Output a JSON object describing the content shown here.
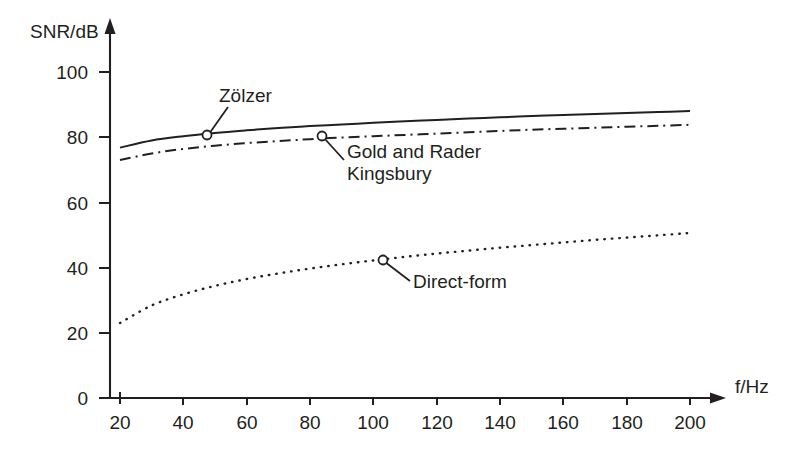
{
  "chart_data": {
    "type": "line",
    "title": "",
    "xlabel": "f/Hz",
    "ylabel": "SNR/dB",
    "xlim": [
      20,
      200
    ],
    "ylim": [
      0,
      100
    ],
    "grid": false,
    "legend_position": "inline-annotations",
    "xticks": [
      20,
      40,
      60,
      80,
      100,
      120,
      140,
      160,
      180,
      200
    ],
    "yticks": [
      0,
      20,
      40,
      60,
      80,
      100
    ],
    "xtick_labels": [
      "20",
      "40",
      "60",
      "80",
      "100",
      "120",
      "140",
      "160",
      "180",
      "200"
    ],
    "ytick_labels": [
      "0",
      "20",
      "40",
      "60",
      "80",
      "100"
    ],
    "x": [
      20,
      30,
      40,
      50,
      60,
      70,
      80,
      90,
      100,
      110,
      120,
      130,
      140,
      150,
      160,
      170,
      180,
      190,
      200
    ],
    "series": [
      {
        "name": "Zölzer",
        "style": "solid",
        "values": [
          76.8,
          79.0,
          80.3,
          81.3,
          82.1,
          82.8,
          83.4,
          83.9,
          84.4,
          84.9,
          85.3,
          85.7,
          86.1,
          86.5,
          86.8,
          87.1,
          87.4,
          87.7,
          88.0
        ],
        "annotation": {
          "label": "Zölzer",
          "marker_x": 46,
          "marker_y": 81.2,
          "text_x": 65,
          "text_y": 95.5
        }
      },
      {
        "name": "Gold and Rader\nKingsbury",
        "style": "dash-dot",
        "values": [
          73.0,
          75.0,
          76.4,
          77.4,
          78.2,
          78.8,
          79.4,
          79.9,
          80.3,
          80.7,
          81.1,
          81.5,
          81.9,
          82.3,
          82.6,
          82.9,
          83.2,
          83.5,
          83.8
        ],
        "annotation": {
          "label_line1": "Gold and Rader",
          "label_line2": "Kingsbury",
          "marker_x": 83,
          "marker_y": 80.5,
          "text_x": 98,
          "text_y": 73.0
        }
      },
      {
        "name": "Direct-form",
        "style": "dotted",
        "values": [
          23.0,
          28.4,
          31.8,
          34.4,
          36.5,
          38.2,
          39.7,
          41.0,
          42.2,
          43.3,
          44.3,
          45.2,
          46.1,
          46.9,
          47.7,
          48.5,
          49.2,
          49.9,
          50.6
        ],
        "annotation": {
          "label": "Direct-form",
          "marker_x": 101,
          "marker_y": 43.0,
          "text_x": 122,
          "text_y": 36.5
        }
      }
    ]
  },
  "axes": {
    "y_axis_title": "SNR/dB",
    "x_axis_title": "f/Hz"
  },
  "labels": {
    "zolzer": "Zölzer",
    "gold_rader": "Gold and Rader",
    "kingsbury": "Kingsbury",
    "direct_form": "Direct-form"
  },
  "colors": {
    "ink": "#231f20",
    "background": "#ffffff"
  }
}
